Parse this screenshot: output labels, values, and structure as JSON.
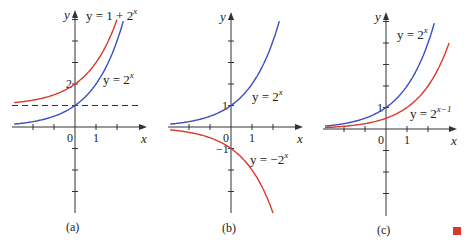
{
  "colors": {
    "blue": "#3a4fc2",
    "red": "#d93a2b",
    "axis": "#333333",
    "end_marker": "#d93a2b"
  },
  "chart_data": [
    {
      "type": "line",
      "panel_label": "(a)",
      "xlabel": "x",
      "ylabel": "y",
      "xlim": [
        -3,
        3.3
      ],
      "ylim": [
        -4,
        5.5
      ],
      "x_ticks": [
        -2,
        -1,
        0,
        1,
        2
      ],
      "y_ticks": [
        -4,
        -3,
        -2,
        -1,
        1,
        2,
        3,
        4,
        5
      ],
      "tick_labels": [
        {
          "axis": "x",
          "value": 0,
          "text": "0"
        },
        {
          "axis": "x",
          "value": 1,
          "text": "1"
        },
        {
          "axis": "y",
          "value": 2,
          "text": "2"
        }
      ],
      "asymptote": {
        "y": 1,
        "style": "dashed"
      },
      "series": [
        {
          "name": "y = 1 + 2^x",
          "label_main": "y = 1 + 2",
          "label_sup": "x",
          "color": "red",
          "func": "1+2^x",
          "x_range": [
            -2.9,
            2.0
          ]
        },
        {
          "name": "y = 2^x",
          "label_main": "y = 2",
          "label_sup": "x",
          "color": "blue",
          "func": "2^x",
          "x_range": [
            -2.9,
            2.3
          ]
        }
      ]
    },
    {
      "type": "line",
      "panel_label": "(b)",
      "xlabel": "x",
      "ylabel": "y",
      "xlim": [
        -3,
        3.3
      ],
      "ylim": [
        -4,
        5.3
      ],
      "x_ticks": [
        -2,
        -1,
        0,
        1,
        2
      ],
      "y_ticks": [
        -4,
        -3,
        -2,
        -1,
        1,
        2,
        3,
        4,
        5
      ],
      "tick_labels": [
        {
          "axis": "x",
          "value": 0,
          "text": "0"
        },
        {
          "axis": "x",
          "value": 1,
          "text": "1"
        },
        {
          "axis": "y",
          "value": 1,
          "text": "1"
        },
        {
          "axis": "y",
          "value": -1,
          "text": "−1"
        }
      ],
      "series": [
        {
          "name": "y = 2^x",
          "label_main": "y = 2",
          "label_sup": "x",
          "color": "blue",
          "func": "2^x",
          "x_range": [
            -2.9,
            2.3
          ]
        },
        {
          "name": "y = -2^x",
          "label_main": "y = −2",
          "label_sup": "x",
          "color": "red",
          "func": "-2^x",
          "x_range": [
            -2.9,
            2.0
          ]
        }
      ]
    },
    {
      "type": "line",
      "panel_label": "(c)",
      "xlabel": "x",
      "ylabel": "y",
      "xlim": [
        -3,
        3.3
      ],
      "ylim": [
        -4,
        5.3
      ],
      "x_ticks": [
        -2,
        -1,
        0,
        1,
        2
      ],
      "y_ticks": [
        -4,
        -3,
        -2,
        -1,
        1,
        2,
        3,
        4,
        5
      ],
      "tick_labels": [
        {
          "axis": "x",
          "value": 0,
          "text": "0"
        },
        {
          "axis": "x",
          "value": 1,
          "text": "1"
        },
        {
          "axis": "y",
          "value": 1,
          "text": "1"
        }
      ],
      "series": [
        {
          "name": "y = 2^x",
          "label_main": "y = 2",
          "label_sup": "x",
          "color": "blue",
          "func": "2^x",
          "x_range": [
            -2.9,
            2.3
          ]
        },
        {
          "name": "y = 2^(x-1)",
          "label_main": "y = 2",
          "label_sup": "x−1",
          "color": "red",
          "func": "2^(x-1)",
          "x_range": [
            -2.9,
            3.0
          ]
        }
      ]
    }
  ]
}
